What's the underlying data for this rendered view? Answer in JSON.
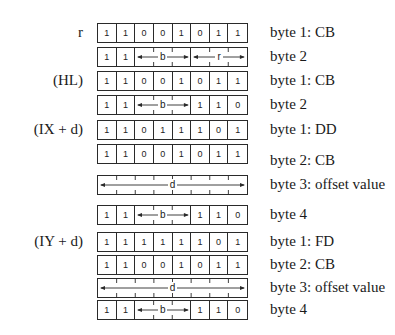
{
  "diagram": {
    "sections": [
      {
        "operand": "r",
        "rows": [
          {
            "top": 23,
            "label": "byte 1: CB",
            "label_offset": 0,
            "kind": "bits",
            "bits": [
              "1",
              "1",
              "0",
              "0",
              "1",
              "0",
              "1",
              "1"
            ]
          },
          {
            "top": 47,
            "label": "byte 2",
            "label_offset": 0,
            "kind": "fields",
            "fields": [
              {
                "bits": [
                  "1"
                ]
              },
              {
                "bits": [
                  "1"
                ]
              },
              {
                "span": 3,
                "letter": "b"
              },
              {
                "span": 3,
                "letter": "r"
              }
            ]
          }
        ]
      },
      {
        "operand": "(HL)",
        "rows": [
          {
            "top": 71,
            "label": "byte 1: CB",
            "label_offset": 0,
            "kind": "bits",
            "bits": [
              "1",
              "1",
              "0",
              "0",
              "1",
              "0",
              "1",
              "1"
            ]
          },
          {
            "top": 95,
            "label": "byte 2",
            "label_offset": 0,
            "kind": "fields",
            "fields": [
              {
                "bits": [
                  "1"
                ]
              },
              {
                "bits": [
                  "1"
                ]
              },
              {
                "span": 3,
                "letter": "b"
              },
              {
                "bits": [
                  "1"
                ]
              },
              {
                "bits": [
                  "1"
                ]
              },
              {
                "bits": [
                  "0"
                ]
              }
            ]
          }
        ]
      },
      {
        "operand": "(IX + d)",
        "rows": [
          {
            "top": 120,
            "label": "byte 1: DD",
            "label_offset": 0,
            "kind": "bits",
            "bits": [
              "1",
              "1",
              "0",
              "1",
              "1",
              "1",
              "0",
              "1"
            ]
          },
          {
            "top": 144,
            "label": "byte 2: CB",
            "label_offset": 7,
            "kind": "bits",
            "bits": [
              "1",
              "1",
              "0",
              "0",
              "1",
              "0",
              "1",
              "1"
            ]
          },
          {
            "top": 175,
            "label": "byte 3: offset value",
            "label_offset": 0,
            "kind": "fields",
            "fields": [
              {
                "span": 8,
                "letter": "d"
              }
            ]
          },
          {
            "top": 205,
            "label": "byte 4",
            "label_offset": 0,
            "kind": "fields",
            "fields": [
              {
                "bits": [
                  "1"
                ]
              },
              {
                "bits": [
                  "1"
                ]
              },
              {
                "span": 3,
                "letter": "b"
              },
              {
                "bits": [
                  "1"
                ]
              },
              {
                "bits": [
                  "1"
                ]
              },
              {
                "bits": [
                  "0"
                ]
              }
            ]
          }
        ]
      },
      {
        "operand": "(IY + d)",
        "rows": [
          {
            "top": 232,
            "label": "byte 1: FD",
            "label_offset": 0,
            "kind": "bits",
            "bits": [
              "1",
              "1",
              "1",
              "1",
              "1",
              "1",
              "0",
              "1"
            ]
          },
          {
            "top": 255,
            "label": "byte 2: CB",
            "label_offset": 0,
            "kind": "bits",
            "bits": [
              "1",
              "1",
              "0",
              "0",
              "1",
              "0",
              "1",
              "1"
            ]
          },
          {
            "top": 278,
            "label": "byte 3: offset value",
            "label_offset": 0,
            "kind": "fields",
            "fields": [
              {
                "span": 8,
                "letter": "d"
              }
            ]
          },
          {
            "top": 300,
            "label": "byte 4",
            "label_offset": 0,
            "kind": "fields",
            "fields": [
              {
                "bits": [
                  "1"
                ]
              },
              {
                "bits": [
                  "1"
                ]
              },
              {
                "span": 3,
                "letter": "b"
              },
              {
                "bits": [
                  "1"
                ]
              },
              {
                "bits": [
                  "1"
                ]
              },
              {
                "bits": [
                  "0"
                ]
              }
            ]
          }
        ]
      }
    ],
    "colors": {
      "line": "#2a2a2a",
      "text": "#1a1a1a",
      "background": "#ffffff"
    }
  }
}
